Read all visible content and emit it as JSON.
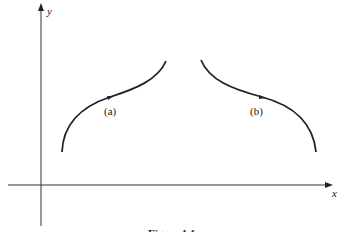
{
  "figure": {
    "caption": "Figure 1.1",
    "axes": {
      "x_label": "x",
      "y_label": "y"
    },
    "curves": [
      {
        "id": "a",
        "label": "(a)",
        "description": "concave-down then concave-up rising curve with arrow pointing right"
      },
      {
        "id": "b",
        "label": "(b)",
        "description": "falling curve, mirror of (a), with arrow pointing right"
      }
    ],
    "colors": {
      "ink": "#222222",
      "background": "#ffffff"
    }
  }
}
